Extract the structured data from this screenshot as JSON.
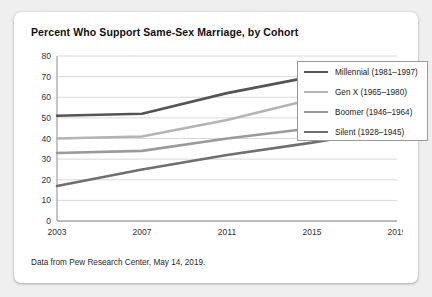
{
  "card": {
    "title": "Percent Who Support Same-Sex Marriage, by Cohort",
    "caption": "Data from Pew Research Center, May 14, 2019."
  },
  "legend": {
    "items": [
      {
        "label": "Millennial (1981–1997)",
        "color": "#555555"
      },
      {
        "label": "Gen X (1965–1980)",
        "color": "#b4b4b4"
      },
      {
        "label": "Boomer (1946–1964)",
        "color": "#9a9a9a"
      },
      {
        "label": "Silent (1928–1945)",
        "color": "#6f6f6f"
      }
    ]
  },
  "chart_data": {
    "type": "line",
    "title": "Percent Who Support Same-Sex Marriage, by Cohort",
    "xlabel": "",
    "ylabel": "",
    "x": [
      "2003",
      "2007",
      "2011",
      "2015",
      "2019"
    ],
    "categories": [
      "2003",
      "2007",
      "2011",
      "2015",
      "2019"
    ],
    "ylim": [
      0,
      80
    ],
    "yticks": [
      0,
      10,
      20,
      30,
      40,
      50,
      60,
      70,
      80
    ],
    "grid": "horizontal",
    "legend_position": "top-right",
    "series": [
      {
        "name": "Millennial (1981–1997)",
        "color": "#555555",
        "values": [
          51,
          52,
          62,
          70,
          74
        ]
      },
      {
        "name": "Gen X (1965–1980)",
        "color": "#b4b4b4",
        "values": [
          40,
          41,
          49,
          59,
          57
        ]
      },
      {
        "name": "Boomer (1946–1964)",
        "color": "#9a9a9a",
        "values": [
          33,
          34,
          40,
          45,
          51
        ]
      },
      {
        "name": "Silent (1928–1945)",
        "color": "#6f6f6f",
        "values": [
          17,
          25,
          32,
          38,
          45
        ]
      }
    ],
    "source_note": "Data from Pew Research Center, May 14, 2019."
  }
}
